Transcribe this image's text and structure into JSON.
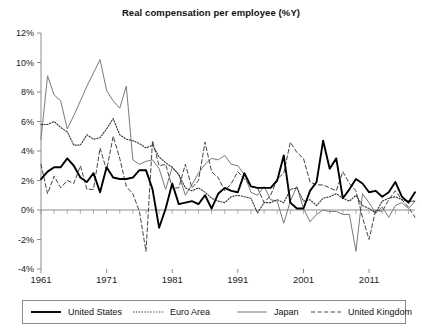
{
  "chart_data": {
    "type": "line",
    "title": "Real compensation per employee (%Y)",
    "xlabel": "",
    "ylabel": "",
    "xlim": [
      1961,
      2018
    ],
    "ylim": [
      -4,
      12
    ],
    "xticks": [
      "1961",
      "1971",
      "1981",
      "1991",
      "2001",
      "2011"
    ],
    "xtick_values": [
      1961,
      1971,
      1981,
      1991,
      2001,
      2011
    ],
    "yticks": [
      "-4%",
      "-2%",
      "0%",
      "2%",
      "4%",
      "6%",
      "8%",
      "10%",
      "12%"
    ],
    "ytick_values": [
      -4,
      -2,
      0,
      2,
      4,
      6,
      8,
      10,
      12
    ],
    "grid": false,
    "zero_line": true,
    "legend_position": "below",
    "x": [
      1961,
      1962,
      1963,
      1964,
      1965,
      1966,
      1967,
      1968,
      1969,
      1970,
      1971,
      1972,
      1973,
      1974,
      1975,
      1976,
      1977,
      1978,
      1979,
      1980,
      1981,
      1982,
      1983,
      1984,
      1985,
      1986,
      1987,
      1988,
      1989,
      1990,
      1991,
      1992,
      1993,
      1994,
      1995,
      1996,
      1997,
      1998,
      1999,
      2000,
      2001,
      2002,
      2003,
      2004,
      2005,
      2006,
      2007,
      2008,
      2009,
      2010,
      2011,
      2012,
      2013,
      2014,
      2015,
      2016,
      2017,
      2018
    ],
    "series": [
      {
        "name": "United States",
        "style": "solid-thick",
        "color": "#000000",
        "values": [
          2.1,
          2.6,
          2.9,
          2.9,
          3.5,
          3.0,
          2.2,
          1.9,
          2.5,
          1.2,
          2.9,
          2.2,
          2.1,
          2.1,
          2.2,
          2.7,
          2.7,
          1.4,
          -1.2,
          0.1,
          1.8,
          0.4,
          0.5,
          0.6,
          0.4,
          1.0,
          0.1,
          1.1,
          1.5,
          1.3,
          1.2,
          2.5,
          1.6,
          1.5,
          1.5,
          1.5,
          2.0,
          3.7,
          0.5,
          0.1,
          0.1,
          1.3,
          1.9,
          4.7,
          2.8,
          3.5,
          0.8,
          1.4,
          2.1,
          1.8,
          1.2,
          1.3,
          0.9,
          1.2,
          1.9,
          0.9,
          0.5,
          1.2
        ]
      },
      {
        "name": "Euro Area",
        "style": "dotted",
        "color": "#333333",
        "values": [
          5.8,
          5.8,
          6.0,
          5.6,
          5.3,
          4.4,
          4.4,
          5.1,
          4.8,
          4.9,
          5.5,
          6.2,
          5.1,
          4.8,
          4.7,
          4.5,
          4.2,
          4.4,
          3.6,
          3.2,
          2.9,
          2.4,
          1.5,
          1.3,
          1.5,
          1.2,
          0.8,
          0.6,
          0.5,
          0.9,
          1.0,
          0.9,
          0.8,
          -0.2,
          0.5,
          0.5,
          0.7,
          0.5,
          1.4,
          1.5,
          0.6,
          0.7,
          0.3,
          0.8,
          0.9,
          1.1,
          0.8,
          0.6,
          1.0,
          0.3,
          0.1,
          -0.2,
          0.6,
          0.8,
          0.9,
          0.7,
          0.6,
          0.6
        ]
      },
      {
        "name": "Japan",
        "style": "solid-thin",
        "color": "#7a7a7a",
        "values": [
          4.8,
          9.1,
          7.8,
          7.4,
          5.5,
          6.4,
          7.4,
          8.4,
          9.3,
          10.2,
          8.1,
          7.4,
          6.9,
          8.4,
          3.4,
          3.1,
          3.3,
          3.4,
          2.8,
          1.4,
          2.9,
          2.4,
          1.0,
          1.7,
          2.5,
          3.1,
          3.5,
          3.4,
          3.7,
          3.1,
          3.0,
          2.4,
          1.2,
          1.0,
          1.6,
          0.7,
          0.6,
          -0.9,
          0.6,
          1.6,
          0.1,
          -0.8,
          -0.3,
          0.0,
          -0.1,
          -0.1,
          -0.3,
          -0.3,
          -2.8,
          1.1,
          0.5,
          -0.2,
          0.2,
          -0.5,
          0.3,
          0.5,
          0.1,
          0.6
        ]
      },
      {
        "name": "United Kingdom",
        "style": "dashed",
        "color": "#444444",
        "values": [
          3.1,
          1.1,
          2.3,
          1.5,
          2.0,
          1.8,
          3.0,
          1.4,
          1.4,
          4.2,
          2.7,
          5.0,
          3.5,
          1.6,
          1.1,
          -0.1,
          -2.8,
          4.7,
          3.0,
          3.1,
          1.5,
          1.5,
          3.1,
          1.5,
          2.0,
          4.6,
          2.6,
          2.2,
          1.3,
          1.8,
          2.6,
          2.1,
          1.6,
          1.5,
          0.5,
          1.0,
          2.1,
          2.5,
          4.6,
          3.9,
          3.5,
          1.9,
          1.7,
          1.7,
          1.5,
          1.3,
          2.6,
          1.8,
          1.3,
          -0.5,
          -2.0,
          0.0,
          -0.1,
          0.7,
          1.3,
          0.7,
          0.2,
          -0.5
        ]
      }
    ]
  },
  "legend": {
    "items": [
      {
        "label": "United States",
        "style": "solid-thick",
        "color": "#000000"
      },
      {
        "label": "Euro Area",
        "style": "dotted",
        "color": "#333333"
      },
      {
        "label": "Japan",
        "style": "solid-thin",
        "color": "#7a7a7a"
      },
      {
        "label": "United Kingdom",
        "style": "dashed",
        "color": "#444444"
      }
    ]
  },
  "axis": {
    "color": "#8c8c8c",
    "zero_line_color": "#8c8c8c"
  }
}
